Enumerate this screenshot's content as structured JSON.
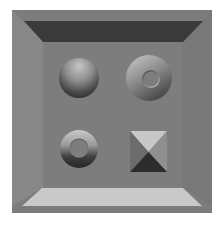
{
  "scene": {
    "description": "Beveled gray frame containing four shaded 3D shapes",
    "colors": {
      "background": "#ffffff",
      "frame_outer": "#7c7c7c",
      "face": "#7d7d7d",
      "bevel_top": "#3a3a3a",
      "bevel_left": "#888888",
      "bevel_right": "#7a7a7a",
      "bevel_bottom": "#c8c8c8",
      "highlight": "#c4c4c4",
      "shadow": "#2a2a2a"
    },
    "shapes": [
      {
        "name": "sphere",
        "position": "top-left",
        "lighting": "lit from top"
      },
      {
        "name": "torus",
        "position": "top-right",
        "lighting": "lit from top-left"
      },
      {
        "name": "ring",
        "position": "bottom-left",
        "lighting": "lit from top"
      },
      {
        "name": "pyramid",
        "position": "bottom-right",
        "lighting": "top face light, bottom face dark"
      }
    ]
  }
}
